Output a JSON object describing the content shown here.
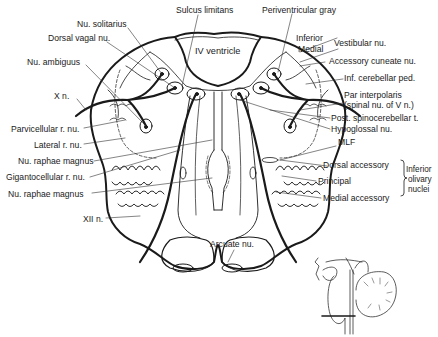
{
  "diagram": {
    "ventricle_label": "IV ventricle",
    "labels_top": {
      "sulcus_limitans": "Sulcus limitans",
      "periventricular_gray": "Periventricular gray"
    },
    "labels_left": [
      {
        "id": "nu-solitarius",
        "text": "Nu. solitarius"
      },
      {
        "id": "dorsal-vagal-nu",
        "text": "Dorsal vagal nu."
      },
      {
        "id": "nu-ambiguus",
        "text": "Nu. ambiguus"
      },
      {
        "id": "x-n",
        "text": "X n."
      },
      {
        "id": "parvicellular-r-nu",
        "text": "Parvicellular r. nu."
      },
      {
        "id": "lateral-r-nu",
        "text": "Lateral r. nu."
      },
      {
        "id": "nu-raphae-magnus-1",
        "text": "Nu. raphae magnus"
      },
      {
        "id": "gigantocellular-r-nu",
        "text": "Gigantocellular r. nu."
      },
      {
        "id": "nu-raphae-magnus-2",
        "text": "Nu. raphae magnus"
      },
      {
        "id": "xii-n",
        "text": "XII n."
      }
    ],
    "labels_right": [
      {
        "id": "vestibular-inferior",
        "text": "Inferior"
      },
      {
        "id": "vestibular-medial",
        "text": "Medial"
      },
      {
        "id": "vestibular-nu",
        "text": "Vestibular nu."
      },
      {
        "id": "accessory-cuneate-nu",
        "text": "Accessory cuneate nu."
      },
      {
        "id": "inf-cerebellar-ped",
        "text": "Inf. cerebellar ped."
      },
      {
        "id": "par-interpolaris",
        "text": "Par interpolaris"
      },
      {
        "id": "spinal-nu-v",
        "text": "(spinal nu. of V n.)"
      },
      {
        "id": "post-spinocerebellar-t",
        "text": "Post. spinocerebellar t."
      },
      {
        "id": "hypoglossal-nu",
        "text": "Hypoglossal nu."
      },
      {
        "id": "mlf",
        "text": "MLF"
      },
      {
        "id": "dorsal-accessory",
        "text": "Dorsal accessory"
      },
      {
        "id": "principal",
        "text": "Principal"
      },
      {
        "id": "medial-accessory",
        "text": "Medial accessory"
      }
    ],
    "bracket_group": {
      "line1": "Inferior",
      "line2": "olivary",
      "line3": "nuclei"
    },
    "labels_bottom": {
      "arcuate_nu": "Arcuate nu."
    },
    "inset": {
      "description": "Sagittal brainstem/cerebellum inset showing level of section"
    },
    "colors": {
      "ink": "#1a1a1a",
      "background": "#ffffff",
      "thin_ink": "#333333"
    }
  }
}
